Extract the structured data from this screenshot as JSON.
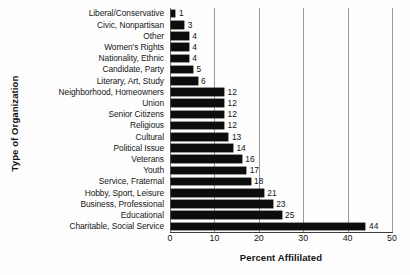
{
  "chart_data": {
    "type": "bar",
    "orientation": "horizontal",
    "title": "",
    "xlabel": "Percent Affililated",
    "ylabel": "Type of Organization",
    "xlim": [
      0,
      50
    ],
    "xticks": [
      0,
      10,
      20,
      30,
      40,
      50
    ],
    "xtick_labels": [
      "0",
      "10",
      "20",
      "30",
      "40",
      "50"
    ],
    "grid": "vertical",
    "legend": "none",
    "bar_color": "#0d0d0d",
    "background_color": "#fdfdfd",
    "gridline_color": "#9a9a9a",
    "categories": [
      "Liberal/Conservative",
      "Civic, Nonpartisan",
      "Other",
      "Women's Rights",
      "Nationality, Ethnic",
      "Candidate, Party",
      "Literary, Art, Study",
      "Neighborhood, Homeowners",
      "Union",
      "Senior Citizens",
      "Religious",
      "Cultural",
      "Political Issue",
      "Veterans",
      "Youth",
      "Service, Fraternal",
      "Hobby, Sport, Leisure",
      "Business, Professional",
      "Educational",
      "Charitable, Social Service"
    ],
    "values": [
      1,
      3,
      4,
      4,
      4,
      5,
      6,
      12,
      12,
      12,
      12,
      13,
      14,
      16,
      17,
      18,
      21,
      23,
      25,
      44
    ],
    "value_labels": [
      "1",
      "3",
      "4",
      "4",
      "4",
      "5",
      "6",
      "12",
      "12",
      "12",
      "12",
      "13",
      "14",
      "16",
      "17",
      "18",
      "21",
      "23",
      "25",
      "44"
    ]
  }
}
